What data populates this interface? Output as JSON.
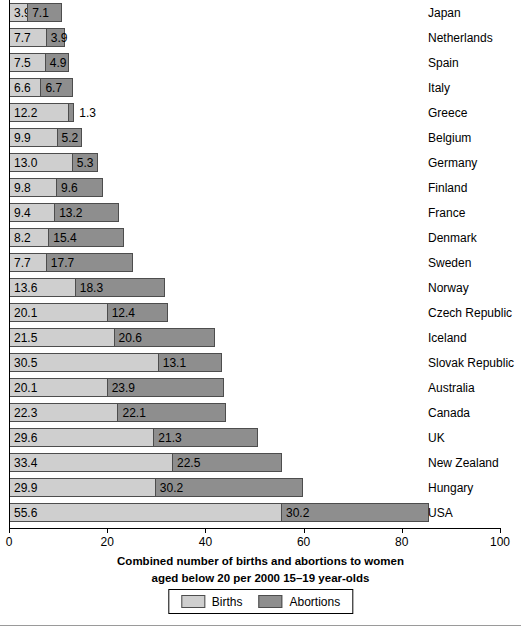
{
  "chart_data": {
    "type": "bar",
    "orientation": "horizontal",
    "stacked": true,
    "title": "",
    "xlabel": "Combined number of births and abortions to women aged below 20 per 2000 15–19 year-olds",
    "xlabel_lines": [
      "Combined number of births and abortions to women",
      "aged below 20 per 2000 15–19 year-olds"
    ],
    "ylabel": "",
    "xlim": [
      0,
      100
    ],
    "xticks": [
      0,
      20,
      40,
      60,
      80,
      100
    ],
    "xtick_labels": [
      "0",
      "20",
      "40",
      "60",
      "80",
      "100"
    ],
    "grid": false,
    "legend_position": "bottom-center",
    "categories": [
      "Japan",
      "Netherlands",
      "Spain",
      "Italy",
      "Greece",
      "Belgium",
      "Germany",
      "Finland",
      "France",
      "Denmark",
      "Sweden",
      "Norway",
      "Czech Republic",
      "Iceland",
      "Slovak Republic",
      "Australia",
      "Canada",
      "UK",
      "New Zealand",
      "Hungary",
      "USA"
    ],
    "series": [
      {
        "name": "Births",
        "color": "#cfcfcf",
        "values": [
          3.9,
          7.7,
          7.5,
          6.6,
          12.2,
          9.9,
          13.0,
          9.8,
          9.4,
          8.2,
          7.7,
          13.6,
          20.1,
          21.5,
          30.5,
          20.1,
          22.3,
          29.6,
          33.4,
          29.9,
          55.6
        ]
      },
      {
        "name": "Abortions",
        "color": "#8e8e8e",
        "values": [
          7.1,
          3.9,
          4.9,
          6.7,
          1.3,
          5.2,
          5.3,
          9.6,
          13.2,
          15.4,
          17.7,
          18.3,
          12.4,
          20.6,
          13.1,
          23.9,
          22.1,
          21.3,
          22.5,
          30.2,
          30.2
        ]
      }
    ],
    "rows": [
      {
        "country": "Japan",
        "births": "3.9",
        "abortions": "7.1",
        "births_value": 3.9,
        "abortions_value": 7.1,
        "abortions_label_outside": false
      },
      {
        "country": "Netherlands",
        "births": "7.7",
        "abortions": "3.9",
        "births_value": 7.7,
        "abortions_value": 3.9,
        "abortions_label_outside": false
      },
      {
        "country": "Spain",
        "births": "7.5",
        "abortions": "4.9",
        "births_value": 7.5,
        "abortions_value": 4.9,
        "abortions_label_outside": false
      },
      {
        "country": "Italy",
        "births": "6.6",
        "abortions": "6.7",
        "births_value": 6.6,
        "abortions_value": 6.7,
        "abortions_label_outside": false
      },
      {
        "country": "Greece",
        "births": "12.2",
        "abortions": "1.3",
        "births_value": 12.2,
        "abortions_value": 1.3,
        "abortions_label_outside": true
      },
      {
        "country": "Belgium",
        "births": "9.9",
        "abortions": "5.2",
        "births_value": 9.9,
        "abortions_value": 5.2,
        "abortions_label_outside": false
      },
      {
        "country": "Germany",
        "births": "13.0",
        "abortions": "5.3",
        "births_value": 13.0,
        "abortions_value": 5.3,
        "abortions_label_outside": false
      },
      {
        "country": "Finland",
        "births": "9.8",
        "abortions": "9.6",
        "births_value": 9.8,
        "abortions_value": 9.6,
        "abortions_label_outside": false
      },
      {
        "country": "France",
        "births": "9.4",
        "abortions": "13.2",
        "births_value": 9.4,
        "abortions_value": 13.2,
        "abortions_label_outside": false
      },
      {
        "country": "Denmark",
        "births": "8.2",
        "abortions": "15.4",
        "births_value": 8.2,
        "abortions_value": 15.4,
        "abortions_label_outside": false
      },
      {
        "country": "Sweden",
        "births": "7.7",
        "abortions": "17.7",
        "births_value": 7.7,
        "abortions_value": 17.7,
        "abortions_label_outside": false
      },
      {
        "country": "Norway",
        "births": "13.6",
        "abortions": "18.3",
        "births_value": 13.6,
        "abortions_value": 18.3,
        "abortions_label_outside": false
      },
      {
        "country": "Czech Republic",
        "births": "20.1",
        "abortions": "12.4",
        "births_value": 20.1,
        "abortions_value": 12.4,
        "abortions_label_outside": false
      },
      {
        "country": "Iceland",
        "births": "21.5",
        "abortions": "20.6",
        "births_value": 21.5,
        "abortions_value": 20.6,
        "abortions_label_outside": false
      },
      {
        "country": "Slovak Republic",
        "births": "30.5",
        "abortions": "13.1",
        "births_value": 30.5,
        "abortions_value": 13.1,
        "abortions_label_outside": false
      },
      {
        "country": "Australia",
        "births": "20.1",
        "abortions": "23.9",
        "births_value": 20.1,
        "abortions_value": 23.9,
        "abortions_label_outside": false
      },
      {
        "country": "Canada",
        "births": "22.3",
        "abortions": "22.1",
        "births_value": 22.3,
        "abortions_value": 22.1,
        "abortions_label_outside": false
      },
      {
        "country": "UK",
        "births": "29.6",
        "abortions": "21.3",
        "births_value": 29.6,
        "abortions_value": 21.3,
        "abortions_label_outside": false
      },
      {
        "country": "New Zealand",
        "births": "33.4",
        "abortions": "22.5",
        "births_value": 33.4,
        "abortions_value": 22.5,
        "abortions_label_outside": false
      },
      {
        "country": "Hungary",
        "births": "29.9",
        "abortions": "30.2",
        "births_value": 29.9,
        "abortions_value": 30.2,
        "abortions_label_outside": false
      },
      {
        "country": "USA",
        "births": "55.6",
        "abortions": "30.2",
        "births_value": 55.6,
        "abortions_value": 30.2,
        "abortions_label_outside": false
      }
    ],
    "legend": [
      {
        "label": "Births",
        "color": "#cfcfcf"
      },
      {
        "label": "Abortions",
        "color": "#8e8e8e"
      }
    ]
  },
  "colors": {
    "births": "#cfcfcf",
    "abortions": "#8e8e8e",
    "bar_outline": "#4d4d4d",
    "axis": "#000000",
    "background": "#ffffff"
  }
}
